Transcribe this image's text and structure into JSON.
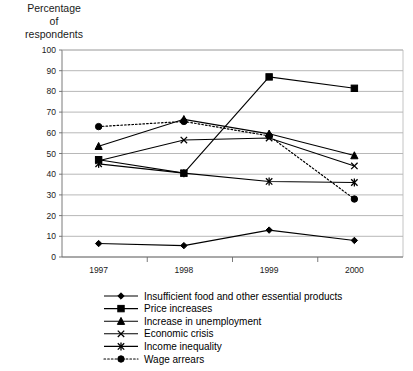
{
  "axis_title": "Percentage\nof\nrespondents",
  "chart_data": {
    "type": "line",
    "title": "",
    "subtitle": "",
    "xlabel": "",
    "ylabel": "Percentage of respondents",
    "categories": [
      "1997",
      "1998",
      "1999",
      "2000"
    ],
    "x": [
      1997,
      1998,
      1999,
      2000
    ],
    "ylim": [
      0,
      100
    ],
    "yticks": [
      0,
      10,
      20,
      30,
      40,
      50,
      60,
      70,
      80,
      90,
      100
    ],
    "grid": true,
    "legend_position": "bottom",
    "series": [
      {
        "name": "Insufficient food and other essential products",
        "marker": "diamond",
        "style": "solid",
        "values": [
          6.5,
          5.5,
          13,
          8
        ]
      },
      {
        "name": "Price increases",
        "marker": "square",
        "style": "solid",
        "values": [
          47,
          40.5,
          87,
          81.5
        ]
      },
      {
        "name": "Increase in unemployment",
        "marker": "triangle",
        "style": "solid",
        "values": [
          53.5,
          66.5,
          59.5,
          49
        ]
      },
      {
        "name": "Economic crisis",
        "marker": "cross",
        "style": "solid",
        "values": [
          46.5,
          56.5,
          57.5,
          44
        ]
      },
      {
        "name": "Income inequality",
        "marker": "asterisk",
        "style": "solid",
        "values": [
          45,
          40.5,
          36.5,
          36
        ]
      },
      {
        "name": "Wage arrears",
        "marker": "circle",
        "style": "dotted",
        "values": [
          63,
          65.5,
          58.5,
          28
        ]
      }
    ]
  },
  "legend": {
    "items": [
      {
        "label": "Insufficient food and other essential products",
        "marker": "diamond",
        "style": "solid"
      },
      {
        "label": "Price increases",
        "marker": "square",
        "style": "solid"
      },
      {
        "label": "Increase in unemployment",
        "marker": "triangle",
        "style": "solid"
      },
      {
        "label": "Economic crisis",
        "marker": "cross",
        "style": "solid"
      },
      {
        "label": "Income inequality",
        "marker": "asterisk",
        "style": "solid"
      },
      {
        "label": "Wage arrears",
        "marker": "circle",
        "style": "dotted"
      }
    ]
  },
  "colors": {
    "series": "#000000",
    "grid": "#9a9a9a",
    "axis": "#6b6b6b",
    "background": "#ffffff"
  }
}
